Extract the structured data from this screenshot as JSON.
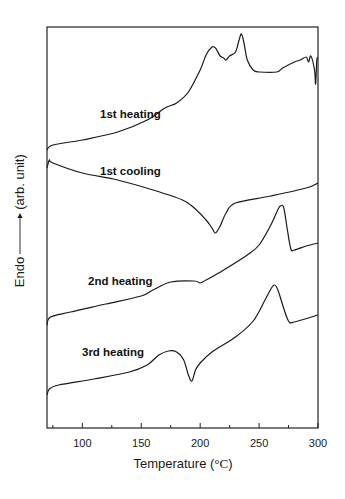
{
  "chart_data": {
    "type": "line",
    "title": "",
    "xlabel": "Temperature (°C)",
    "ylabel": "Endo ——→(arb. unit)",
    "xlim": [
      70,
      300
    ],
    "ylim": "arbitrary (pixel-space offsets, stacked curves)",
    "xticks": [
      100,
      150,
      200,
      250,
      300
    ],
    "minor_xticks": [
      75,
      125,
      175,
      225,
      275
    ],
    "grid": false,
    "legend": "none (inline curve labels)",
    "y_units_note": "y values are vertical positions in image pixels (smaller = higher on plot = more endothermic)",
    "series": [
      {
        "name": "1st heating",
        "label_pos": [
          100,
          118
        ],
        "x": [
          70,
          75,
          100,
          130,
          155,
          170,
          180,
          190,
          200,
          205,
          210,
          213,
          217,
          220,
          222,
          225,
          230,
          233,
          235,
          237,
          240,
          245,
          250,
          265,
          270,
          280,
          285,
          290,
          292,
          294,
          297,
          298,
          299,
          300
        ],
        "y": [
          150,
          145,
          140,
          132,
          120,
          108,
          103,
          92,
          70,
          55,
          47,
          48,
          56,
          58,
          60,
          56,
          52,
          40,
          34,
          42,
          60,
          70,
          72,
          72,
          68,
          62,
          60,
          57,
          62,
          56,
          70,
          84,
          60,
          58
        ]
      },
      {
        "name": "1st cooling",
        "label_pos": [
          100,
          175
        ],
        "x": [
          70,
          72,
          75,
          100,
          130,
          160,
          185,
          195,
          205,
          210,
          213,
          217,
          222,
          230,
          260,
          290,
          300
        ],
        "y": [
          168,
          160,
          163,
          173,
          180,
          190,
          200,
          208,
          220,
          228,
          233,
          226,
          213,
          203,
          196,
          188,
          183
        ]
      },
      {
        "name": "2nd heating",
        "label_pos": [
          88,
          285
        ],
        "x": [
          70,
          73,
          90,
          120,
          150,
          160,
          175,
          195,
          200,
          205,
          220,
          240,
          250,
          260,
          265,
          268,
          271,
          274,
          277,
          280,
          290,
          300
        ],
        "y": [
          325,
          317,
          312,
          304,
          296,
          290,
          282,
          281,
          283,
          280,
          270,
          255,
          245,
          225,
          212,
          206,
          208,
          230,
          249,
          250,
          246,
          243
        ]
      },
      {
        "name": "3rd heating",
        "label_pos": [
          82,
          356
        ],
        "x": [
          70,
          72,
          80,
          110,
          140,
          155,
          165,
          173,
          180,
          186,
          190,
          193,
          196,
          200,
          210,
          230,
          245,
          255,
          260,
          263,
          266,
          270,
          275,
          280,
          300
        ],
        "y": [
          395,
          389,
          385,
          379,
          372,
          365,
          355,
          351,
          352,
          360,
          375,
          381,
          370,
          363,
          352,
          337,
          321,
          300,
          289,
          285,
          290,
          305,
          321,
          322,
          315
        ]
      }
    ]
  },
  "axes": {
    "x_title": "Temperature (",
    "x_title_unit": "°C",
    "x_title_close": ")",
    "y_title_left": "Endo",
    "y_title_right": "(arb. unit)",
    "tick_labels": [
      "100",
      "150",
      "200",
      "250",
      "300"
    ]
  },
  "style": {
    "line_color": "#1a1a1a",
    "frame_color": "#222222",
    "background": "#ffffff"
  }
}
